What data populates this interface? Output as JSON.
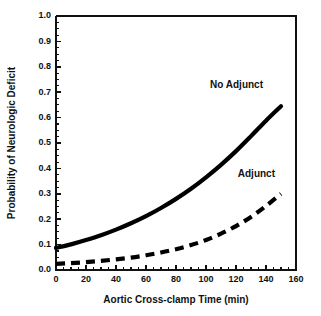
{
  "chart_data": {
    "type": "line",
    "title": "",
    "xlabel": "Aortic Cross-clamp Time (min)",
    "ylabel": "Probability of Neurologic Deficit",
    "xlim": [
      0,
      160
    ],
    "ylim": [
      0.0,
      1.0
    ],
    "grid": false,
    "legend_position": "inline-annotation",
    "x_ticks": [
      "0",
      "20",
      "40",
      "60",
      "80",
      "100",
      "120",
      "140",
      "160"
    ],
    "x_tick_values": [
      0,
      20,
      40,
      60,
      80,
      100,
      120,
      140,
      160
    ],
    "x_minor_tick_step": 5,
    "y_ticks": [
      "0.0",
      "0.1",
      "0.2",
      "0.3",
      "0.4",
      "0.5",
      "0.6",
      "0.7",
      "0.8",
      "0.9",
      "1.0"
    ],
    "y_tick_values": [
      0.0,
      0.1,
      0.2,
      0.3,
      0.4,
      0.5,
      0.6,
      0.7,
      0.8,
      0.9,
      1.0
    ],
    "y_minor_tick_step": 0.025,
    "x": [
      0,
      10,
      20,
      30,
      40,
      50,
      60,
      70,
      80,
      90,
      100,
      110,
      120,
      130,
      140,
      150
    ],
    "series": [
      {
        "name": "No Adjunct",
        "style": "solid",
        "color": "#000000",
        "values": [
          0.087,
          0.101,
          0.118,
          0.137,
          0.159,
          0.184,
          0.212,
          0.244,
          0.28,
          0.32,
          0.365,
          0.414,
          0.468,
          0.527,
          0.588,
          0.645
        ]
      },
      {
        "name": "Adjunct",
        "style": "dashed",
        "color": "#000000",
        "values": [
          0.024,
          0.027,
          0.031,
          0.036,
          0.042,
          0.049,
          0.058,
          0.069,
          0.082,
          0.098,
          0.118,
          0.143,
          0.173,
          0.209,
          0.252,
          0.3
        ]
      }
    ],
    "annotations": [
      {
        "text": "No Adjunct",
        "x": 138,
        "y": 0.715
      },
      {
        "text": "Adjunct",
        "x": 146,
        "y": 0.368
      }
    ]
  },
  "figure": {
    "background_color": "#ffffff",
    "axis_color": "#111111"
  }
}
